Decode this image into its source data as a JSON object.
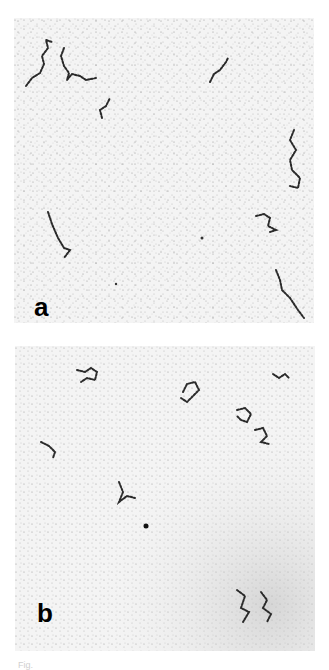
{
  "figure": {
    "panels": [
      {
        "id": "a",
        "label": "a",
        "description": "Electron micrograph field showing extended, thread-like molecules on a speckled background"
      },
      {
        "id": "b",
        "label": "b",
        "description": "Electron micrograph field showing compact, condensed molecule clusters on a speckled background"
      }
    ],
    "caption_fragment": "Fig."
  },
  "colors": {
    "background": "#ffffff",
    "panel_background": "#f4f4f4",
    "strand": "#2a2a2a",
    "label": "#000000"
  }
}
